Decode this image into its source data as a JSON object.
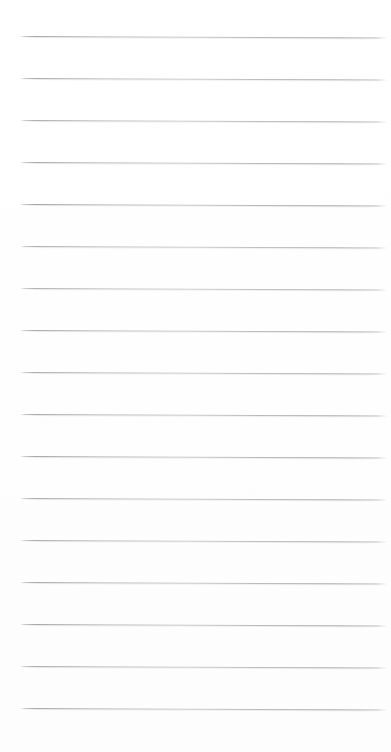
{
  "document": {
    "kind": "lined-notebook-page",
    "title": "Blank ruled page",
    "page_width": 391,
    "page_height": 752,
    "background_color": "#ffffff",
    "rule_color": "#96969a",
    "rule_thickness": 1,
    "rule_count": 17,
    "rule_spacing": 42,
    "first_rule_y": 36,
    "rule_left_x": 20,
    "rule_right_x": 387,
    "scan_skew_degrees": 0.22,
    "top_margin": 36,
    "bottom_margin": 42,
    "text_content": "",
    "has_text": false,
    "has_margin_line": false,
    "has_holes": false
  },
  "rules": [
    {
      "index": 1,
      "y": 36,
      "left": 20,
      "right": 387,
      "opacity": 0.9
    },
    {
      "index": 2,
      "y": 78,
      "left": 20,
      "right": 387,
      "opacity": 0.86
    },
    {
      "index": 3,
      "y": 120,
      "left": 20,
      "right": 387,
      "opacity": 0.84
    },
    {
      "index": 4,
      "y": 162,
      "left": 20,
      "right": 387,
      "opacity": 0.88
    },
    {
      "index": 5,
      "y": 204,
      "left": 20,
      "right": 387,
      "opacity": 0.92
    },
    {
      "index": 6,
      "y": 246,
      "left": 20,
      "right": 387,
      "opacity": 0.82
    },
    {
      "index": 7,
      "y": 288,
      "left": 20,
      "right": 387,
      "opacity": 0.8
    },
    {
      "index": 8,
      "y": 330,
      "left": 20,
      "right": 387,
      "opacity": 0.86
    },
    {
      "index": 9,
      "y": 372,
      "left": 20,
      "right": 387,
      "opacity": 0.84
    },
    {
      "index": 10,
      "y": 414,
      "left": 20,
      "right": 387,
      "opacity": 0.88
    },
    {
      "index": 11,
      "y": 456,
      "left": 20,
      "right": 387,
      "opacity": 0.9
    },
    {
      "index": 12,
      "y": 498,
      "left": 20,
      "right": 387,
      "opacity": 0.86
    },
    {
      "index": 13,
      "y": 540,
      "left": 20,
      "right": 387,
      "opacity": 0.83
    },
    {
      "index": 14,
      "y": 582,
      "left": 20,
      "right": 387,
      "opacity": 0.87
    },
    {
      "index": 15,
      "y": 624,
      "left": 20,
      "right": 387,
      "opacity": 0.89
    },
    {
      "index": 16,
      "y": 666,
      "left": 20,
      "right": 387,
      "opacity": 0.85
    },
    {
      "index": 17,
      "y": 708,
      "left": 20,
      "right": 387,
      "opacity": 0.88
    }
  ]
}
